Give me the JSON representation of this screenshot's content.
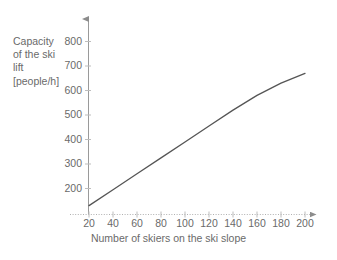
{
  "chart_data": {
    "type": "line",
    "title": "",
    "xlabel": "Number of skiers on the ski slope",
    "ylabel": "Capacity of the ski lift [people/h]",
    "ylabel_lines": [
      "Capacity",
      "of the ski",
      "lift",
      "[people/h]"
    ],
    "xlim": [
      14,
      208
    ],
    "ylim": [
      90,
      840
    ],
    "xticks": [
      20,
      40,
      60,
      80,
      100,
      120,
      140,
      160,
      180,
      200
    ],
    "yticks": [
      200,
      300,
      400,
      500,
      600,
      700,
      800
    ],
    "xtick_labels": [
      "20",
      "40",
      "60",
      "80",
      "100",
      "120",
      "140",
      "160",
      "180",
      "200"
    ],
    "ytick_labels": [
      "200",
      "300",
      "400",
      "500",
      "600",
      "700",
      "800"
    ],
    "grid": false,
    "legend": null,
    "series": [
      {
        "name": "Capacity of the ski lift",
        "color": "#555555",
        "x": [
          20,
          40,
          60,
          80,
          100,
          120,
          140,
          160,
          180,
          200
        ],
        "values": [
          130,
          195,
          260,
          325,
          390,
          455,
          520,
          580,
          630,
          670
        ]
      }
    ],
    "axis_color": "#8c8c8c",
    "text_color": "#6a6a6a",
    "background": "#ffffff",
    "axis_arrows": true
  }
}
